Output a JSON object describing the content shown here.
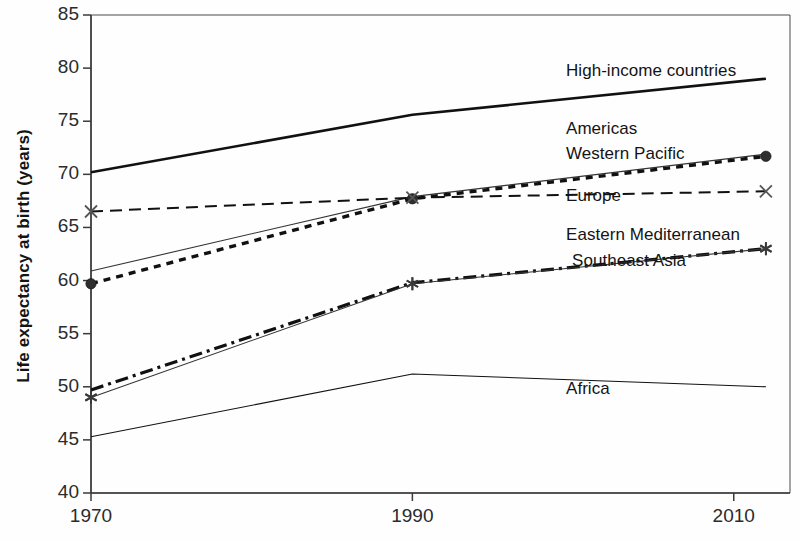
{
  "chart_data": {
    "type": "line",
    "title": "",
    "xlabel": "",
    "ylabel": "Life expectancy at birth (years)",
    "xlim": [
      1970,
      2013.5
    ],
    "ylim": [
      40,
      85
    ],
    "xticks": [
      1970,
      1990,
      2010
    ],
    "xtick_labels": [
      "1970",
      "1990",
      "2010"
    ],
    "yticks": [
      40,
      45,
      50,
      55,
      60,
      65,
      70,
      75,
      80,
      85
    ],
    "ytick_labels": [
      "40",
      "45",
      "50",
      "55",
      "60",
      "65",
      "70",
      "75",
      "80",
      "85"
    ],
    "grid": false,
    "legend_position": "right-inline-labels",
    "series": [
      {
        "name": "High-income countries",
        "label": "High-income countries",
        "style": "solid-thick",
        "color": "#111111",
        "marker": "none",
        "x": [
          1970,
          1990,
          2012
        ],
        "values": [
          70.2,
          75.6,
          79.0
        ]
      },
      {
        "name": "Americas",
        "label": "Americas",
        "style": "solid-thin",
        "color": "#333333",
        "marker": "none",
        "x": [
          1970,
          1990,
          2012
        ],
        "values": [
          60.9,
          67.9,
          71.9
        ]
      },
      {
        "name": "Western Pacific",
        "label": "Western Pacific",
        "style": "dotted-thick",
        "color": "#111111",
        "marker": "circle",
        "x": [
          1970,
          1990,
          2012
        ],
        "values": [
          59.7,
          67.7,
          71.7
        ]
      },
      {
        "name": "Europe",
        "label": "Europe",
        "style": "dashed",
        "color": "#111111",
        "marker": "x",
        "x": [
          1970,
          1990,
          2012
        ],
        "values": [
          66.5,
          67.8,
          68.4
        ]
      },
      {
        "name": "Eastern Mediterranean",
        "label": "Eastern Mediterranean",
        "style": "dash-dot-thick",
        "color": "#111111",
        "marker": "none",
        "x": [
          1970,
          1990,
          2012
        ],
        "values": [
          49.7,
          59.8,
          63.0
        ]
      },
      {
        "name": "Southeast Asia",
        "label": "Southeast Asia",
        "style": "solid-thin",
        "color": "#333333",
        "marker": "asterisk",
        "x": [
          1970,
          1990,
          2012
        ],
        "values": [
          49.0,
          59.7,
          63.0
        ]
      },
      {
        "name": "Africa",
        "label": "Africa",
        "style": "solid-thin",
        "color": "#111111",
        "marker": "none",
        "x": [
          1970,
          1990,
          2012
        ],
        "values": [
          45.3,
          51.2,
          50.0
        ]
      }
    ],
    "series_labels": [
      {
        "text": "High-income countries",
        "x": 566,
        "y": 72
      },
      {
        "text": "Americas",
        "x": 566,
        "y": 130
      },
      {
        "text": "Western Pacific",
        "x": 566,
        "y": 155
      },
      {
        "text": "Europe",
        "x": 566,
        "y": 197
      },
      {
        "text": "Eastern Mediterranean",
        "x": 566,
        "y": 236
      },
      {
        "text": "Southeast Asia",
        "x": 572,
        "y": 262
      },
      {
        "text": "Africa",
        "x": 566,
        "y": 390
      }
    ]
  }
}
